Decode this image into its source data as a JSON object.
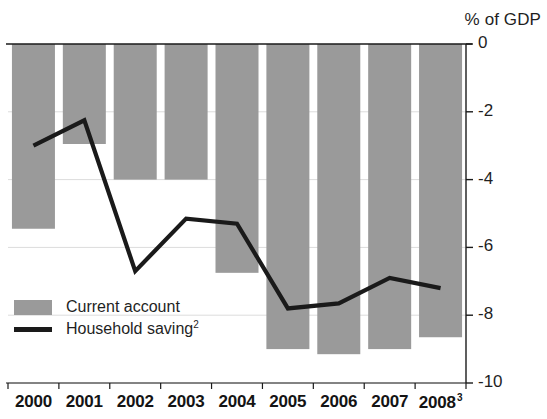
{
  "chart_data": {
    "type": "bar",
    "title": "",
    "subtitle": "",
    "xlabel": "",
    "ylabel": "% of GDP",
    "axis_title": "% of GDP",
    "categories": [
      "2000",
      "2001",
      "2002",
      "2003",
      "2004",
      "2005",
      "2006",
      "2007",
      "2008"
    ],
    "category_superscripts": [
      "",
      "",
      "",
      "",
      "",
      "",
      "",
      "",
      "3"
    ],
    "ylim": [
      -10,
      0
    ],
    "yticks": [
      0,
      -2,
      -4,
      -6,
      -8,
      -10
    ],
    "ytick_labels": [
      "0",
      "-2",
      "-4",
      "-6",
      "-8",
      "-10"
    ],
    "grid": true,
    "legend_position": "inside-lower-left",
    "series": [
      {
        "name": "Current account",
        "type": "bar",
        "color": "#9a9a9a",
        "values": [
          -5.45,
          -2.95,
          -4.0,
          -4.0,
          -6.75,
          -9.0,
          -9.15,
          -9.0,
          -8.65
        ]
      },
      {
        "name": "Household saving",
        "name_superscript": "2",
        "type": "line",
        "color": "#1a1a1a",
        "values": [
          -3.0,
          -2.25,
          -6.7,
          -5.15,
          -5.3,
          -7.8,
          -7.65,
          -6.9,
          -7.2
        ]
      }
    ]
  },
  "legend": {
    "items": [
      {
        "label": "Current account",
        "sup": "",
        "marker": "bar-swatch",
        "color": "#9a9a9a"
      },
      {
        "label": "Household saving",
        "sup": "2",
        "marker": "line-swatch",
        "color": "#1a1a1a"
      }
    ]
  },
  "colors": {
    "bar": "#9a9a9a",
    "line": "#1a1a1a",
    "axis": "#1a1a1a",
    "grid": "#dcdcdc",
    "text": "#1f1f1f",
    "background": "#ffffff"
  }
}
